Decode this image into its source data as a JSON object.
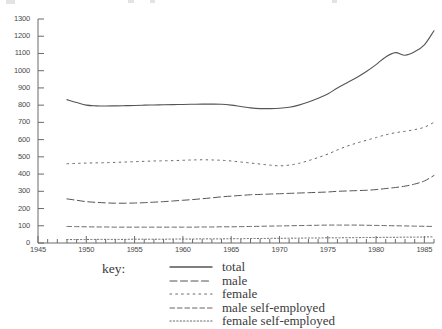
{
  "chart_data": {
    "type": "line",
    "title": "",
    "xlabel": "",
    "ylabel": "",
    "xlim": [
      1945,
      1986
    ],
    "ylim": [
      0,
      1300
    ],
    "grid": false,
    "legend_position": "below-center",
    "legend_title": "key:",
    "y_ticks": [
      0,
      100,
      200,
      300,
      400,
      500,
      600,
      700,
      800,
      900,
      1000,
      1100,
      1200,
      1300
    ],
    "x_ticks": [
      1945,
      1950,
      1955,
      1960,
      1965,
      1970,
      1975,
      1980,
      1985
    ],
    "x_minor_tick_step": 1,
    "x": [
      1948,
      1949,
      1950,
      1951,
      1952,
      1953,
      1954,
      1955,
      1956,
      1957,
      1958,
      1959,
      1960,
      1961,
      1962,
      1963,
      1964,
      1965,
      1966,
      1967,
      1968,
      1969,
      1970,
      1971,
      1972,
      1973,
      1974,
      1975,
      1976,
      1977,
      1978,
      1979,
      1980,
      1981,
      1982,
      1983,
      1984,
      1985,
      1986
    ],
    "series": [
      {
        "name": "total",
        "style": "solid",
        "color": "#555555",
        "values": [
          832,
          815,
          800,
          796,
          795,
          796,
          797,
          798,
          800,
          801,
          802,
          803,
          804,
          805,
          806,
          806,
          805,
          800,
          792,
          784,
          780,
          780,
          782,
          788,
          800,
          818,
          840,
          865,
          900,
          930,
          960,
          995,
          1035,
          1080,
          1105,
          1090,
          1110,
          1150,
          1232
        ]
      },
      {
        "name": "male",
        "style": "dashed",
        "color": "#555555",
        "values": [
          256,
          248,
          240,
          236,
          233,
          231,
          231,
          232,
          234,
          237,
          240,
          244,
          248,
          252,
          257,
          262,
          268,
          272,
          276,
          280,
          282,
          284,
          286,
          288,
          290,
          292,
          294,
          296,
          300,
          302,
          304,
          306,
          310,
          316,
          322,
          330,
          342,
          360,
          392
        ]
      },
      {
        "name": "female",
        "style": "dotted-wide",
        "color": "#666666",
        "values": [
          460,
          462,
          464,
          465,
          466,
          468,
          470,
          472,
          474,
          476,
          477,
          478,
          480,
          482,
          483,
          482,
          480,
          476,
          470,
          464,
          458,
          452,
          448,
          452,
          462,
          478,
          496,
          516,
          540,
          562,
          580,
          596,
          612,
          628,
          640,
          648,
          658,
          672,
          700
        ]
      },
      {
        "name": "male self-employed",
        "style": "dashed-fine",
        "color": "#666666",
        "values": [
          96,
          95,
          94,
          93,
          93,
          92,
          92,
          92,
          92,
          92,
          92,
          92,
          92,
          92,
          93,
          93,
          94,
          94,
          95,
          96,
          97,
          98,
          99,
          100,
          101,
          102,
          103,
          104,
          104,
          104,
          104,
          103,
          102,
          101,
          100,
          99,
          98,
          97,
          96
        ]
      },
      {
        "name": "female self-employed",
        "style": "dotted-fine",
        "color": "#666666",
        "values": [
          20,
          20,
          20,
          21,
          21,
          21,
          21,
          22,
          22,
          22,
          22,
          23,
          23,
          23,
          24,
          24,
          24,
          25,
          25,
          26,
          26,
          27,
          27,
          28,
          28,
          29,
          29,
          30,
          30,
          31,
          31,
          32,
          32,
          33,
          33,
          34,
          34,
          35,
          36
        ]
      }
    ]
  }
}
